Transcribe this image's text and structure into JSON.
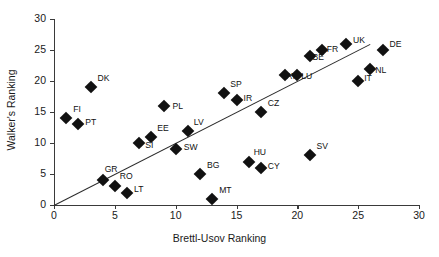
{
  "chart_data": {
    "type": "scatter",
    "title": "",
    "xlabel": "Brettl-Usov Ranking",
    "ylabel": "Walker's Ranking",
    "xlim": [
      0,
      30
    ],
    "ylim": [
      0,
      30
    ],
    "xticks": [
      0,
      5,
      10,
      15,
      20,
      25,
      30
    ],
    "yticks": [
      0,
      5,
      10,
      15,
      20,
      25,
      30
    ],
    "grid": false,
    "legend": "none",
    "marker": "filled-diamond",
    "marker_color": "#111111",
    "trendline": {
      "description": "45-degree reference line through the origin",
      "x": [
        0,
        26
      ],
      "y": [
        0,
        26
      ],
      "color": "#2b2b2b"
    },
    "points": [
      {
        "label": "FI",
        "x": 1,
        "y": 14,
        "lx": 7,
        "ly": -9
      },
      {
        "label": "PT",
        "x": 2,
        "y": 13,
        "lx": 7,
        "ly": -2
      },
      {
        "label": "DK",
        "x": 3,
        "y": 19,
        "lx": 7,
        "ly": -9
      },
      {
        "label": "GR",
        "x": 4,
        "y": 4,
        "lx": 2,
        "ly": -11
      },
      {
        "label": "RO",
        "x": 5,
        "y": 3,
        "lx": 5,
        "ly": -10
      },
      {
        "label": "LT",
        "x": 6,
        "y": 2,
        "lx": 7,
        "ly": -4
      },
      {
        "label": "SI",
        "x": 7,
        "y": 10,
        "lx": 6,
        "ly": 2
      },
      {
        "label": "EE",
        "x": 8,
        "y": 11,
        "lx": 6,
        "ly": -9
      },
      {
        "label": "PL",
        "x": 9,
        "y": 16,
        "lx": 9,
        "ly": 0
      },
      {
        "label": "SW",
        "x": 10,
        "y": 9,
        "lx": 8,
        "ly": -2
      },
      {
        "label": "LV",
        "x": 11,
        "y": 12,
        "lx": 6,
        "ly": -9
      },
      {
        "label": "BG",
        "x": 12,
        "y": 5,
        "lx": 7,
        "ly": -9
      },
      {
        "label": "MT",
        "x": 13,
        "y": 1,
        "lx": 7,
        "ly": -9
      },
      {
        "label": "SP",
        "x": 14,
        "y": 18,
        "lx": 6,
        "ly": -9
      },
      {
        "label": "IR",
        "x": 15,
        "y": 17,
        "lx": 7,
        "ly": -2
      },
      {
        "label": "HU",
        "x": 16,
        "y": 7,
        "lx": 5,
        "ly": -10
      },
      {
        "label": "CY",
        "x": 17,
        "y": 6,
        "lx": 7,
        "ly": -2
      },
      {
        "label": "CZ",
        "x": 17,
        "y": 15,
        "lx": 7,
        "ly": -9
      },
      {
        "label": "AT",
        "x": 19,
        "y": 21,
        "lx": 1,
        "ly": 1
      },
      {
        "label": "LU",
        "x": 20,
        "y": 21,
        "lx": 4,
        "ly": 1
      },
      {
        "label": "SV",
        "x": 21,
        "y": 8,
        "lx": 7,
        "ly": -9
      },
      {
        "label": "BE",
        "x": 21,
        "y": 24,
        "lx": 3,
        "ly": 1
      },
      {
        "label": "FR",
        "x": 22,
        "y": 25,
        "lx": 5,
        "ly": -1
      },
      {
        "label": "UK",
        "x": 24,
        "y": 26,
        "lx": 7,
        "ly": -4
      },
      {
        "label": "IT",
        "x": 25,
        "y": 20,
        "lx": 6,
        "ly": -3
      },
      {
        "label": "NL",
        "x": 26,
        "y": 22,
        "lx": 5,
        "ly": 1
      },
      {
        "label": "DE",
        "x": 27,
        "y": 25,
        "lx": 7,
        "ly": -6
      }
    ]
  }
}
